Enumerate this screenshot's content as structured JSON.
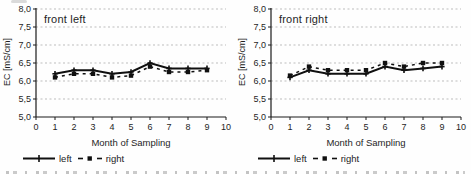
{
  "colors": {
    "series": "#101010",
    "grid": "#bdbdbd",
    "axis": "#1a1a1a",
    "text": "#1f1f1f",
    "background": "#fefefe"
  },
  "chart_data": [
    {
      "type": "line",
      "title": "front left",
      "xlabel": "Month of Sampling",
      "ylabel": "EC [mS/cm]",
      "xlim": [
        0,
        10
      ],
      "ylim": [
        5.0,
        8.0
      ],
      "grid": "horizontal-dashed",
      "legend_position": "below",
      "xticks": [
        {
          "v": 0,
          "label": "0"
        },
        {
          "v": 1,
          "label": "1"
        },
        {
          "v": 2,
          "label": "2"
        },
        {
          "v": 3,
          "label": "3"
        },
        {
          "v": 4,
          "label": "4"
        },
        {
          "v": 5,
          "label": "5"
        },
        {
          "v": 6,
          "label": "6"
        },
        {
          "v": 7,
          "label": "7"
        },
        {
          "v": 8,
          "label": "8"
        },
        {
          "v": 9,
          "label": "9"
        },
        {
          "v": 10,
          "label": "10"
        }
      ],
      "yticks": [
        {
          "v": 5.0,
          "label": "5,0"
        },
        {
          "v": 5.5,
          "label": "5,5"
        },
        {
          "v": 6.0,
          "label": "6,0"
        },
        {
          "v": 6.5,
          "label": "6,5"
        },
        {
          "v": 7.0,
          "label": "7,0"
        },
        {
          "v": 7.5,
          "label": "7,5"
        },
        {
          "v": 8.0,
          "label": "8,0"
        }
      ],
      "x": [
        1,
        2,
        3,
        4,
        5,
        6,
        7,
        8,
        9
      ],
      "series": [
        {
          "name": "left",
          "line": "solid",
          "marker": "plus",
          "values": [
            6.2,
            6.3,
            6.3,
            6.2,
            6.25,
            6.5,
            6.35,
            6.35,
            6.35
          ]
        },
        {
          "name": "right",
          "line": "dashed",
          "marker": "square",
          "values": [
            6.1,
            6.2,
            6.2,
            6.1,
            6.15,
            6.4,
            6.25,
            6.25,
            6.3
          ]
        }
      ]
    },
    {
      "type": "line",
      "title": "front right",
      "xlabel": "Month of Sampling",
      "ylabel": "EC [mS/cm]",
      "xlim": [
        0,
        10
      ],
      "ylim": [
        5.0,
        8.0
      ],
      "grid": "horizontal-dashed",
      "legend_position": "below",
      "xticks": [
        {
          "v": 0,
          "label": "0"
        },
        {
          "v": 1,
          "label": "1"
        },
        {
          "v": 2,
          "label": "2"
        },
        {
          "v": 3,
          "label": "3"
        },
        {
          "v": 4,
          "label": "4"
        },
        {
          "v": 5,
          "label": "5"
        },
        {
          "v": 6,
          "label": "6"
        },
        {
          "v": 7,
          "label": "7"
        },
        {
          "v": 8,
          "label": "8"
        },
        {
          "v": 9,
          "label": "9"
        },
        {
          "v": 10,
          "label": "10"
        }
      ],
      "yticks": [
        {
          "v": 5.0,
          "label": "5,0"
        },
        {
          "v": 5.5,
          "label": "5,5"
        },
        {
          "v": 6.0,
          "label": "6,0"
        },
        {
          "v": 6.5,
          "label": "6,5"
        },
        {
          "v": 7.0,
          "label": "7,0"
        },
        {
          "v": 7.5,
          "label": "7,5"
        },
        {
          "v": 8.0,
          "label": "8,0"
        }
      ],
      "x": [
        1,
        2,
        3,
        4,
        5,
        6,
        7,
        8,
        9
      ],
      "series": [
        {
          "name": "left",
          "line": "solid",
          "marker": "plus",
          "values": [
            6.1,
            6.3,
            6.2,
            6.2,
            6.2,
            6.4,
            6.3,
            6.35,
            6.4
          ]
        },
        {
          "name": "right",
          "line": "dashed",
          "marker": "square",
          "values": [
            6.15,
            6.4,
            6.3,
            6.3,
            6.3,
            6.5,
            6.4,
            6.5,
            6.5
          ]
        }
      ]
    }
  ]
}
